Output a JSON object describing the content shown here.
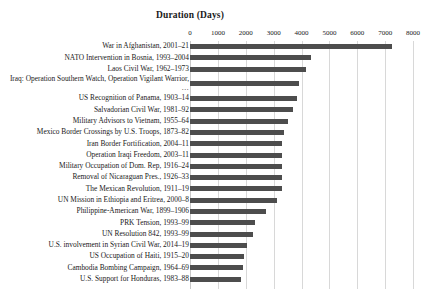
{
  "chart_data": {
    "type": "bar",
    "orientation": "horizontal",
    "title": "Duration (Days)",
    "xlabel": "",
    "ylabel": "",
    "xlim": [
      0,
      8000
    ],
    "xticks": [
      0,
      1000,
      2000,
      3000,
      4000,
      5000,
      6000,
      7000,
      8000
    ],
    "xtick_labels": [
      "0",
      "1000",
      "2000",
      "3000",
      "4000",
      "5000",
      "6000",
      "7000",
      "8000"
    ],
    "grid": true,
    "legend": "none",
    "bar_color": "#4d4d4d",
    "categories": [
      "War in Afghanistan, 2001–21",
      "NATO Intervention in Bosnia, 1993–2004",
      "Laos Civil War, 1962–1973",
      "Iraq: Operation Southern Watch, Operation Vigilant Warrior, …",
      "US Recognition of Panama, 1903–14",
      "Salvadorian Civil War, 1981–92",
      "Military Advisors to Vietnam, 1955–64",
      "Mexico Border Crossings by U.S. Troops, 1873–82",
      "Iran Border Fortification, 2004–11",
      "Operation Iraqi Freedom, 2003–11",
      "Military Occupation of Dom. Rep, 1916–24",
      "Removal of Nicaraguan Pres., 1926–33",
      "The Mexican Revolution, 1911–19",
      "UN Mission in Ethiopia and Eritrea, 2000–8",
      "Philippine-American War, 1899–1906",
      "PRK Tension, 1993–99",
      "UN Resolution 842, 1993–99",
      "U.S. involvement in Syrian Civil War, 2014–19",
      "US Occupation of Haiti, 1915–20",
      "Cambodia Bombing Campaign, 1964–69",
      "U.S. Support for Honduras, 1983–88"
    ],
    "values": [
      7240,
      4350,
      4170,
      3920,
      3850,
      3700,
      3530,
      3380,
      3310,
      3300,
      3300,
      3290,
      3300,
      3130,
      2730,
      2340,
      2270,
      2050,
      1940,
      1910,
      1830
    ]
  }
}
